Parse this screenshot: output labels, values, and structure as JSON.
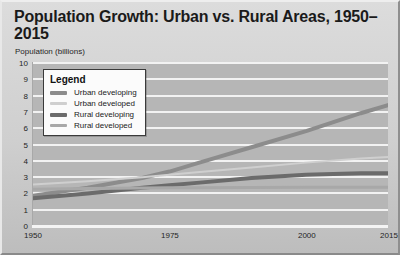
{
  "chart_data": {
    "type": "line",
    "title": "Population Growth: Urban vs. Rural Areas, 1950–2015",
    "ylabel": "Population (billions)",
    "xlabel": "",
    "ylim": [
      0,
      10
    ],
    "xlim": [
      1950,
      2015
    ],
    "yticks": [
      0,
      1,
      2,
      3,
      4,
      5,
      6,
      7,
      8,
      9,
      10
    ],
    "xticks": [
      1950,
      1975,
      2000,
      2015
    ],
    "grid": "horizontal",
    "legend_position": "top-left",
    "legend_title": "Legend",
    "x": [
      1950,
      1960,
      1970,
      1975,
      1980,
      1990,
      2000,
      2010,
      2015
    ],
    "series": [
      {
        "name": "Urban developing",
        "color": "#8c8c8c",
        "width": 4,
        "values": [
          1.8,
          2.3,
          2.9,
          3.3,
          3.8,
          4.8,
          5.8,
          6.9,
          7.4
        ]
      },
      {
        "name": "Urban developed",
        "color": "#cfcfcf",
        "width": 2,
        "values": [
          2.5,
          2.7,
          2.95,
          3.1,
          3.25,
          3.55,
          3.85,
          4.1,
          4.2
        ]
      },
      {
        "name": "Rural developing",
        "color": "#6b6b6b",
        "width": 4,
        "values": [
          1.65,
          1.95,
          2.3,
          2.45,
          2.6,
          2.9,
          3.1,
          3.2,
          3.2
        ]
      },
      {
        "name": "Rural developed",
        "color": "#a8a8a8",
        "width": 3,
        "values": [
          2.2,
          2.25,
          2.28,
          2.3,
          2.3,
          2.32,
          2.33,
          2.33,
          2.33
        ]
      }
    ]
  }
}
